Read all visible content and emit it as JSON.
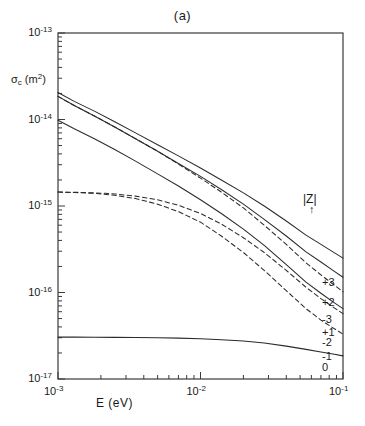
{
  "figure": {
    "panel_title": "(a)",
    "ylabel_main": "σ",
    "ylabel_sub": "c",
    "ylabel_units": "(m",
    "ylabel_units_sup": "2",
    "ylabel_units_close": ")",
    "xlabel": "E  (eV)",
    "legend_title": "|Z|",
    "legend_arrow": "↑"
  },
  "axes": {
    "x_tick_labels": [
      "10",
      "10",
      "10"
    ],
    "x_tick_exponents": [
      "-3",
      "-2",
      "-1"
    ],
    "x_tick_values": [
      0.001,
      0.01,
      0.1
    ],
    "y_tick_labels": [
      "10",
      "10",
      "10",
      "10",
      "10"
    ],
    "y_tick_exponents": [
      "-13",
      "-14",
      "-15",
      "-16",
      "-17"
    ],
    "y_tick_values": [
      1e-13,
      1e-14,
      1e-15,
      1e-16,
      1e-17
    ]
  },
  "curve_labels": [
    {
      "text": "+3",
      "y_px": 283
    },
    {
      "text": "+2",
      "y_px": 303
    },
    {
      "text": "-3",
      "y_px": 320
    },
    {
      "text": "+1",
      "y_px": 333
    },
    {
      "text": "-2",
      "y_px": 343
    },
    {
      "text": "-1",
      "y_px": 357
    },
    {
      "text": "0",
      "y_px": 368
    }
  ],
  "chart_data": {
    "type": "line",
    "title": "(a)",
    "xlabel": "E  (eV)",
    "ylabel": "σc (m2)",
    "xscale": "log",
    "yscale": "log",
    "xlim": [
      0.001,
      0.1
    ],
    "ylim": [
      1e-17,
      1e-13
    ],
    "grid": false,
    "legend_title": "|Z|",
    "legend_position": "right-inside",
    "x": [
      0.001,
      0.0013,
      0.0018,
      0.0025,
      0.0035,
      0.005,
      0.007,
      0.01,
      0.014,
      0.02,
      0.028,
      0.04,
      0.055,
      0.07,
      0.085,
      0.1
    ],
    "series": [
      {
        "name": "+3",
        "label": "+3",
        "style": "solid",
        "values": [
          2.05e-14,
          1.62e-14,
          1.25e-14,
          9.4e-15,
          7e-15,
          5.1e-15,
          3.8e-15,
          2.75e-15,
          2e-15,
          1.42e-15,
          1e-15,
          6.7e-16,
          4.6e-16,
          3.6e-16,
          2.95e-16,
          2.5e-16
        ]
      },
      {
        "name": "+2",
        "label": "+2",
        "style": "solid",
        "values": [
          1.85e-14,
          1.45e-14,
          1.1e-14,
          8.2e-15,
          6e-15,
          4.3e-15,
          3.1e-15,
          2.2e-15,
          1.55e-15,
          1.05e-15,
          7e-16,
          4.5e-16,
          2.95e-16,
          2.25e-16,
          1.8e-16,
          1.5e-16
        ]
      },
      {
        "name": "-3",
        "label": "-3",
        "style": "dashed",
        "values": [
          1.85e-14,
          1.45e-14,
          1.1e-14,
          8.2e-15,
          6e-15,
          4.3e-15,
          3.05e-15,
          2.1e-15,
          1.45e-15,
          9.5e-16,
          6e-16,
          3.6e-16,
          2.2e-16,
          1.6e-16,
          1.25e-16,
          1.02e-16
        ]
      },
      {
        "name": "+1",
        "label": "+1",
        "style": "solid",
        "values": [
          9.8e-15,
          7.8e-15,
          6e-15,
          4.5e-15,
          3.3e-15,
          2.35e-15,
          1.7e-15,
          1.18e-15,
          8.2e-16,
          5.4e-16,
          3.5e-16,
          2.1e-16,
          1.32e-16,
          9.8e-17,
          7.8e-17,
          6.5e-17
        ]
      },
      {
        "name": "-2",
        "label": "-2",
        "style": "dashed",
        "values": [
          1.45e-15,
          1.44e-15,
          1.42e-15,
          1.38e-15,
          1.3e-15,
          1.18e-15,
          1.02e-15,
          8.2e-16,
          6.2e-16,
          4.3e-16,
          2.9e-16,
          1.8e-16,
          1.15e-16,
          8.5e-17,
          6.8e-17,
          5.7e-17
        ]
      },
      {
        "name": "-1",
        "label": "-1",
        "style": "dashed",
        "values": [
          1.45e-15,
          1.43e-15,
          1.4e-15,
          1.33e-15,
          1.22e-15,
          1.05e-15,
          8.6e-16,
          6.5e-16,
          4.5e-16,
          2.9e-16,
          1.8e-16,
          1.05e-16,
          6.5e-17,
          4.8e-17,
          3.9e-17,
          3.3e-17
        ]
      },
      {
        "name": "0",
        "label": "0",
        "style": "solid",
        "values": [
          3.05e-17,
          3.05e-17,
          3.04e-17,
          3.03e-17,
          3.02e-17,
          3e-17,
          2.97e-17,
          2.92e-17,
          2.85e-17,
          2.75e-17,
          2.6e-17,
          2.4e-17,
          2.2e-17,
          2.05e-17,
          1.95e-17,
          1.85e-17
        ]
      }
    ]
  }
}
